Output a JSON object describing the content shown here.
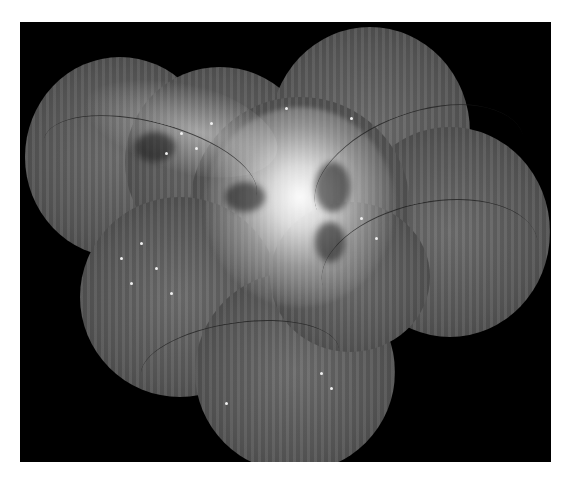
{
  "image": {
    "subject": "fundus-photograph-montage",
    "description": "Grayscale wide-field retinal montage with bright central optic disc swelling, exudates and hemorrhages",
    "colors": {
      "background": "#ffffff",
      "frame": "#000000",
      "retina": "#5e5e5e",
      "highlight": "#f5f5f5"
    }
  }
}
